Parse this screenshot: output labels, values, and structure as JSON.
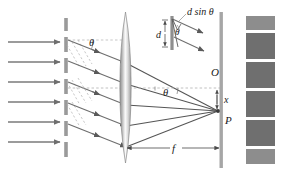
{
  "figure": {
    "background": "#ffffff",
    "width": 281,
    "height": 177
  },
  "colors": {
    "ray": "#6e6e6e",
    "ray_dark": "#4a4a4a",
    "grating": "#9a9a9a",
    "screen": "#a0a0a0",
    "fringe": "#6f6f6f",
    "fringe_light": "#8d8d8d",
    "dashed": "#a8a8a8",
    "lens_edge": "#8a8a8a",
    "label": "#1a1a1a"
  },
  "labels": {
    "theta_grating": "θ",
    "theta_axis": "θ",
    "theta_inset": "θ",
    "path_difference": "d sin θ",
    "slit_spacing": "d",
    "center_point": "O",
    "image_point": "P",
    "offset": "x",
    "focal_length": "f"
  },
  "elements": {
    "incoming_beam": {
      "name": "incident-plane-wave",
      "arrow_count": 6,
      "arrow_y": [
        42,
        62,
        82,
        102,
        122,
        142
      ],
      "x_start": 8,
      "x_end": 62
    },
    "grating": {
      "name": "diffraction-grating",
      "x": 66,
      "dash_count": 8,
      "y_top": 18,
      "y_bottom": 160
    },
    "diffracted_rays": {
      "name": "diffracted-parallel-rays",
      "count": 5,
      "direction": "down-right"
    },
    "wavefronts": {
      "name": "dashed-wavefront-lines",
      "count": 6,
      "style": "dashed"
    },
    "lens": {
      "name": "converging-lens",
      "x": 125,
      "y_top": 12,
      "y_bottom": 163,
      "half_width": 7
    },
    "optical_axis": {
      "name": "optical-axis-dashed",
      "y": 88,
      "x_start": 68,
      "x_end": 222
    },
    "screen": {
      "name": "focal-plane-screen",
      "x": 221,
      "y_top": 12,
      "y_bottom": 168
    },
    "fringe_pattern": {
      "name": "interference-fringe-pattern",
      "x": 245,
      "width": 30,
      "bands": [
        {
          "y": 16,
          "h": 14,
          "shade": "#8d8d8d"
        },
        {
          "y": 33,
          "h": 26,
          "shade": "#6f6f6f"
        },
        {
          "y": 62,
          "h": 26,
          "shade": "#6f6f6f"
        },
        {
          "y": 91,
          "h": 26,
          "shade": "#6f6f6f"
        },
        {
          "y": 120,
          "h": 26,
          "shade": "#6f6f6f"
        },
        {
          "y": 149,
          "h": 15,
          "shade": "#8d8d8d"
        }
      ]
    },
    "focal_point": {
      "name": "focus-point-P",
      "x": 218,
      "y": 111
    },
    "inset": {
      "name": "slit-geometry-inset",
      "description": "enlarged view of two adjacent slits showing spacing d and path difference d sin theta"
    }
  }
}
